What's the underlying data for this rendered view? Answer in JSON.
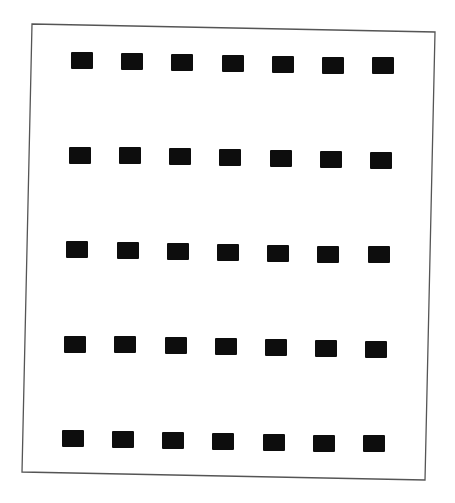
{
  "figure": {
    "type": "grid-of-squares",
    "rows": 5,
    "columns": 7,
    "background_color": "#ffffff",
    "square_color": "#0d0d0d",
    "frame_color": "#555555",
    "frame_corners": {
      "top_left": [
        32,
        24
      ],
      "top_right": [
        435,
        32
      ],
      "bottom_right": [
        425,
        480
      ],
      "bottom_left": [
        22,
        472
      ]
    },
    "square_size": [
      22,
      17
    ],
    "grid_origin": [
      71,
      52
    ],
    "column_step": [
      50.2,
      0.9
    ],
    "row_step": [
      -2.3,
      94.5
    ]
  }
}
